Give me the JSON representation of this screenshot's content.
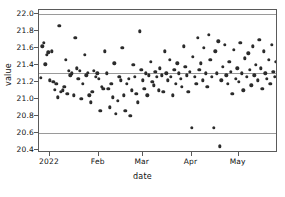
{
  "chart_data": {
    "type": "scatter",
    "title": "",
    "xlabel": "date",
    "ylabel": "value",
    "ylim": [
      20.36,
      22.05
    ],
    "xlim": [
      0,
      152
    ],
    "grid": true,
    "gridlines_y": [
      22.0,
      21.3,
      20.6
    ],
    "legend": null,
    "yticks": [
      20.4,
      20.6,
      20.8,
      21.0,
      21.2,
      21.4,
      21.6,
      21.8,
      22.0
    ],
    "ytick_labels": [
      "20.4",
      "20.6",
      "20.8",
      "21.0",
      "21.2",
      "21.4",
      "21.6",
      "21.8",
      "22.0"
    ],
    "xticks": [
      7,
      38,
      66,
      97,
      127
    ],
    "xtick_labels": [
      "2022",
      "Feb",
      "Mar",
      "Apr",
      "May"
    ],
    "marker": "circle",
    "marker_color": "#2b2b2b",
    "points": [
      {
        "x": 1,
        "y": 21.25
      },
      {
        "x": 2,
        "y": 21.62
      },
      {
        "x": 3,
        "y": 21.66
      },
      {
        "x": 4,
        "y": 21.41
      },
      {
        "x": 5,
        "y": 21.52
      },
      {
        "x": 6,
        "y": 21.55
      },
      {
        "x": 7,
        "y": 21.22
      },
      {
        "x": 8,
        "y": 21.56
      },
      {
        "x": 9,
        "y": 21.2
      },
      {
        "x": 10,
        "y": 21.11
      },
      {
        "x": 11,
        "y": 21.18
      },
      {
        "x": 12,
        "y": 21.02
      },
      {
        "x": 13,
        "y": 21.86
      },
      {
        "x": 14,
        "y": 21.08
      },
      {
        "x": 15,
        "y": 21.1
      },
      {
        "x": 16,
        "y": 21.14
      },
      {
        "x": 17,
        "y": 21.46
      },
      {
        "x": 18,
        "y": 21.06
      },
      {
        "x": 19,
        "y": 21.33
      },
      {
        "x": 20,
        "y": 21.28
      },
      {
        "x": 21,
        "y": 21.3
      },
      {
        "x": 22,
        "y": 21.04
      },
      {
        "x": 23,
        "y": 21.72
      },
      {
        "x": 24,
        "y": 21.36
      },
      {
        "x": 25,
        "y": 21.24
      },
      {
        "x": 26,
        "y": 21.33
      },
      {
        "x": 27,
        "y": 21.0
      },
      {
        "x": 28,
        "y": 21.18
      },
      {
        "x": 29,
        "y": 21.52
      },
      {
        "x": 30,
        "y": 21.28
      },
      {
        "x": 31,
        "y": 21.31
      },
      {
        "x": 32,
        "y": 21.04
      },
      {
        "x": 33,
        "y": 20.96
      },
      {
        "x": 34,
        "y": 21.08
      },
      {
        "x": 35,
        "y": 21.33
      },
      {
        "x": 36,
        "y": 21.26
      },
      {
        "x": 37,
        "y": 21.3
      },
      {
        "x": 38,
        "y": 21.24
      },
      {
        "x": 39,
        "y": 20.86
      },
      {
        "x": 40,
        "y": 21.14
      },
      {
        "x": 41,
        "y": 21.12
      },
      {
        "x": 42,
        "y": 21.56
      },
      {
        "x": 43,
        "y": 21.3
      },
      {
        "x": 44,
        "y": 21.12
      },
      {
        "x": 45,
        "y": 20.9
      },
      {
        "x": 46,
        "y": 21.18
      },
      {
        "x": 47,
        "y": 21.02
      },
      {
        "x": 48,
        "y": 21.42
      },
      {
        "x": 49,
        "y": 20.82
      },
      {
        "x": 50,
        "y": 20.98
      },
      {
        "x": 51,
        "y": 21.26
      },
      {
        "x": 52,
        "y": 21.22
      },
      {
        "x": 53,
        "y": 21.6
      },
      {
        "x": 54,
        "y": 21.04
      },
      {
        "x": 55,
        "y": 20.86
      },
      {
        "x": 56,
        "y": 21.18
      },
      {
        "x": 57,
        "y": 21.24
      },
      {
        "x": 58,
        "y": 20.8
      },
      {
        "x": 59,
        "y": 21.1
      },
      {
        "x": 60,
        "y": 21.4
      },
      {
        "x": 61,
        "y": 21.26
      },
      {
        "x": 62,
        "y": 21.06
      },
      {
        "x": 63,
        "y": 20.96
      },
      {
        "x": 64,
        "y": 21.8
      },
      {
        "x": 65,
        "y": 21.34
      },
      {
        "x": 66,
        "y": 21.22
      },
      {
        "x": 67,
        "y": 21.12
      },
      {
        "x": 68,
        "y": 21.3
      },
      {
        "x": 69,
        "y": 21.04
      },
      {
        "x": 70,
        "y": 21.28
      },
      {
        "x": 71,
        "y": 21.44
      },
      {
        "x": 72,
        "y": 21.2
      },
      {
        "x": 73,
        "y": 21.16
      },
      {
        "x": 74,
        "y": 21.32
      },
      {
        "x": 75,
        "y": 21.26
      },
      {
        "x": 76,
        "y": 21.1
      },
      {
        "x": 77,
        "y": 21.36
      },
      {
        "x": 78,
        "y": 21.28
      },
      {
        "x": 79,
        "y": 21.08
      },
      {
        "x": 80,
        "y": 21.56
      },
      {
        "x": 81,
        "y": 21.3
      },
      {
        "x": 82,
        "y": 21.22
      },
      {
        "x": 83,
        "y": 21.46
      },
      {
        "x": 84,
        "y": 21.26
      },
      {
        "x": 85,
        "y": 21.04
      },
      {
        "x": 86,
        "y": 21.34
      },
      {
        "x": 87,
        "y": 21.18
      },
      {
        "x": 88,
        "y": 21.42
      },
      {
        "x": 89,
        "y": 21.3
      },
      {
        "x": 90,
        "y": 21.24
      },
      {
        "x": 91,
        "y": 21.14
      },
      {
        "x": 92,
        "y": 21.62
      },
      {
        "x": 93,
        "y": 21.38
      },
      {
        "x": 94,
        "y": 21.28
      },
      {
        "x": 95,
        "y": 21.08
      },
      {
        "x": 96,
        "y": 21.32
      },
      {
        "x": 97,
        "y": 20.66
      },
      {
        "x": 98,
        "y": 21.5
      },
      {
        "x": 99,
        "y": 21.26
      },
      {
        "x": 100,
        "y": 21.18
      },
      {
        "x": 101,
        "y": 21.72
      },
      {
        "x": 102,
        "y": 21.34
      },
      {
        "x": 103,
        "y": 21.42
      },
      {
        "x": 104,
        "y": 21.22
      },
      {
        "x": 105,
        "y": 21.6
      },
      {
        "x": 106,
        "y": 21.3
      },
      {
        "x": 107,
        "y": 21.14
      },
      {
        "x": 108,
        "y": 21.76
      },
      {
        "x": 109,
        "y": 21.46
      },
      {
        "x": 110,
        "y": 21.26
      },
      {
        "x": 111,
        "y": 20.66
      },
      {
        "x": 112,
        "y": 21.56
      },
      {
        "x": 113,
        "y": 21.3
      },
      {
        "x": 114,
        "y": 21.68
      },
      {
        "x": 115,
        "y": 20.44
      },
      {
        "x": 116,
        "y": 21.22
      },
      {
        "x": 117,
        "y": 21.38
      },
      {
        "x": 118,
        "y": 21.64
      },
      {
        "x": 119,
        "y": 21.28
      },
      {
        "x": 120,
        "y": 21.18
      },
      {
        "x": 121,
        "y": 21.44
      },
      {
        "x": 122,
        "y": 21.32
      },
      {
        "x": 123,
        "y": 21.06
      },
      {
        "x": 124,
        "y": 21.58
      },
      {
        "x": 125,
        "y": 21.24
      },
      {
        "x": 126,
        "y": 21.36
      },
      {
        "x": 127,
        "y": 21.2
      },
      {
        "x": 128,
        "y": 21.66
      },
      {
        "x": 129,
        "y": 21.3
      },
      {
        "x": 130,
        "y": 21.1
      },
      {
        "x": 131,
        "y": 21.48
      },
      {
        "x": 132,
        "y": 21.26
      },
      {
        "x": 133,
        "y": 21.54
      },
      {
        "x": 134,
        "y": 21.34
      },
      {
        "x": 135,
        "y": 21.16
      },
      {
        "x": 136,
        "y": 21.62
      },
      {
        "x": 137,
        "y": 21.28
      },
      {
        "x": 138,
        "y": 21.4
      },
      {
        "x": 139,
        "y": 21.22
      },
      {
        "x": 140,
        "y": 21.7
      },
      {
        "x": 141,
        "y": 21.36
      },
      {
        "x": 142,
        "y": 21.12
      },
      {
        "x": 143,
        "y": 21.56
      },
      {
        "x": 144,
        "y": 21.3
      },
      {
        "x": 145,
        "y": 21.24
      },
      {
        "x": 146,
        "y": 21.46
      },
      {
        "x": 147,
        "y": 21.18
      },
      {
        "x": 148,
        "y": 21.64
      },
      {
        "x": 149,
        "y": 21.32
      },
      {
        "x": 150,
        "y": 21.26
      },
      {
        "x": 151,
        "y": 21.44
      },
      {
        "x": 152,
        "y": 21.2
      }
    ]
  }
}
